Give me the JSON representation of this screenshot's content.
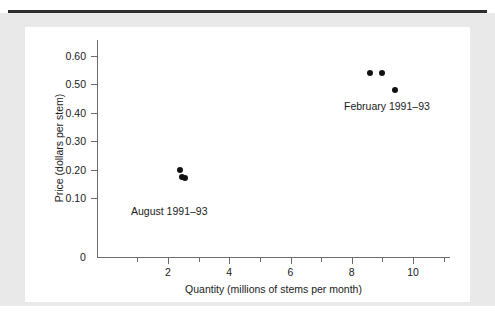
{
  "chart_data": {
    "type": "scatter",
    "title": "",
    "xlabel": "Quantity (millions of stems per month)",
    "ylabel": "Price (dollars per stem)",
    "xlim": [
      0,
      11.5
    ],
    "ylim": [
      0,
      0.65
    ],
    "grid": false,
    "legend_position": "inline-annotations",
    "x_ticks": [
      {
        "value": 2,
        "label": "2"
      },
      {
        "value": 4,
        "label": "4"
      },
      {
        "value": 6,
        "label": "6"
      },
      {
        "value": 8,
        "label": "8"
      },
      {
        "value": 10,
        "label": "10"
      }
    ],
    "x_minor_ticks": [
      1,
      3,
      5,
      7,
      9,
      11
    ],
    "y_ticks": [
      {
        "value": 0.1,
        "label": "0.10"
      },
      {
        "value": 0.2,
        "label": "0.20"
      },
      {
        "value": 0.3,
        "label": "0.30"
      },
      {
        "value": 0.4,
        "label": "0.40"
      },
      {
        "value": 0.5,
        "label": "0.50"
      },
      {
        "value": 0.6,
        "label": "0.60"
      }
    ],
    "origin_label": "0",
    "series": [
      {
        "name": "February 1991–93",
        "label": "February 1991–93",
        "marker_color": "#111111",
        "points": [
          {
            "x": 8.6,
            "y": 0.54
          },
          {
            "x": 9.0,
            "y": 0.54
          },
          {
            "x": 9.4,
            "y": 0.48
          }
        ]
      },
      {
        "name": "August 1991–93",
        "label": "August 1991–93",
        "marker_color": "#111111",
        "points": [
          {
            "x": 2.4,
            "y": 0.2
          },
          {
            "x": 2.45,
            "y": 0.175
          },
          {
            "x": 2.55,
            "y": 0.17
          }
        ]
      }
    ],
    "annotations": [
      {
        "text": "February 1991–93",
        "x": 8.1,
        "y": 0.41
      },
      {
        "text": "August 1991–93",
        "x": 1.1,
        "y": 0.125
      }
    ]
  },
  "figure": {
    "background_color": "#ffffff",
    "margin_color": "#e9e9e9",
    "rule_color": "#2e2e2e",
    "axis_color": "#6b6b6b",
    "text_color": "#1a1a1a"
  }
}
